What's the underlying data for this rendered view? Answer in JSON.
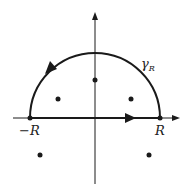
{
  "diagram": {
    "labels": {
      "contour": "γ",
      "contour_sub": "R",
      "left_endpoint": "−R",
      "right_endpoint": "R"
    },
    "colors": {
      "stroke": "#1a1a1a",
      "background": "#ffffff"
    },
    "axes": {
      "x_origin": 95,
      "y_origin": 118
    },
    "semicircle": {
      "cx": 95,
      "cy": 118,
      "r": 65,
      "direction": "counterclockwise"
    },
    "points": [
      {
        "x": 95,
        "y": 80
      },
      {
        "x": 58,
        "y": 99
      },
      {
        "x": 131,
        "y": 99
      },
      {
        "x": 40,
        "y": 155
      },
      {
        "x": 149,
        "y": 155
      }
    ]
  }
}
